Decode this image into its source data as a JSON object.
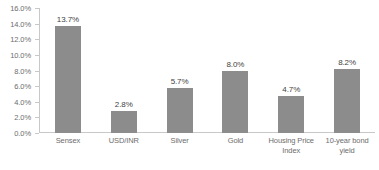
{
  "chart_data": {
    "type": "bar",
    "title": "",
    "subtitle": "",
    "xlabel": "",
    "ylabel": "",
    "categories": [
      "Sensex",
      "USD/INR",
      "Silver",
      "Gold",
      "Housing Price Index",
      "10-year bond yield"
    ],
    "values": [
      13.7,
      2.8,
      5.7,
      8.0,
      4.7,
      8.2
    ],
    "data_labels": [
      "13.7%",
      "2.8%",
      "5.7%",
      "8.0%",
      "4.7%",
      "8.2%"
    ],
    "ylim": [
      0,
      16
    ],
    "ytick_values": [
      0,
      2,
      4,
      6,
      8,
      10,
      12,
      14,
      16
    ],
    "ytick_labels": [
      "0.0%",
      "2.0%",
      "4.0%",
      "6.0%",
      "8.0%",
      "10.0%",
      "12.0%",
      "14.0%",
      "16.0%"
    ],
    "grid": false,
    "legend": false,
    "legend_position": "none",
    "colors": {
      "bar": "#8c8c8c",
      "axis": "#c8c8c8",
      "tick_text": "#6d6d6d",
      "value_text": "#3f3f3f",
      "background": "#ffffff"
    },
    "category_label_lines": [
      [
        "Sensex"
      ],
      [
        "USD/INR"
      ],
      [
        "Silver"
      ],
      [
        "Gold"
      ],
      [
        "Housing Price",
        "Index"
      ],
      [
        "10-year bond",
        "yield"
      ]
    ]
  }
}
